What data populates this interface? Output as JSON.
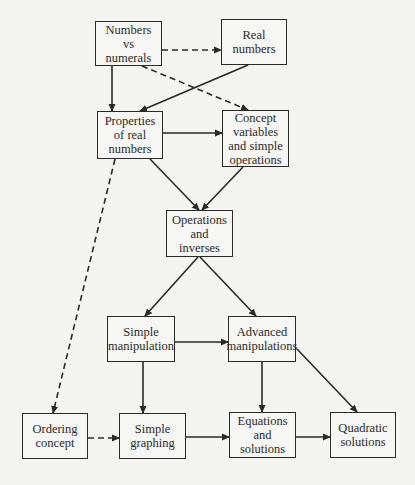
{
  "diagram": {
    "type": "flowchart",
    "nodes": [
      {
        "id": "numbers_vs_numerals",
        "label": "Numbers\nvs\nnumerals",
        "x": 95,
        "y": 21,
        "w": 67,
        "h": 45
      },
      {
        "id": "real_numbers",
        "label": "Real\nnumbers",
        "x": 221,
        "y": 19,
        "w": 66,
        "h": 46
      },
      {
        "id": "properties_of_real_numbers",
        "label": "Properties\nof real\nnumbers",
        "x": 97,
        "y": 111,
        "w": 66,
        "h": 48
      },
      {
        "id": "concept_variables",
        "label": "Concept\nvariables\nand simple\noperations",
        "x": 222,
        "y": 110,
        "w": 67,
        "h": 57
      },
      {
        "id": "operations_and_inverses",
        "label": "Operations\nand\ninverses",
        "x": 166,
        "y": 210,
        "w": 67,
        "h": 47
      },
      {
        "id": "simple_manipulation",
        "label": "Simple\nmanipulation",
        "x": 107,
        "y": 316,
        "w": 68,
        "h": 46
      },
      {
        "id": "advanced_manipulations",
        "label": "Advanced\nmanipulations",
        "x": 228,
        "y": 316,
        "w": 68,
        "h": 46
      },
      {
        "id": "ordering_concept",
        "label": "Ordering\nconcept",
        "x": 22,
        "y": 413,
        "w": 66,
        "h": 46
      },
      {
        "id": "simple_graphing",
        "label": "Simple\ngraphing",
        "x": 119,
        "y": 413,
        "w": 67,
        "h": 46
      },
      {
        "id": "equations_and_solutions",
        "label": "Equations\nand\nsolutions",
        "x": 229,
        "y": 412,
        "w": 67,
        "h": 46
      },
      {
        "id": "quadratic_solutions",
        "label": "Quadratic\nsolutions",
        "x": 330,
        "y": 412,
        "w": 66,
        "h": 46
      }
    ],
    "edges": [
      {
        "from": "numbers_vs_numerals",
        "to": "real_numbers",
        "style": "dashed",
        "x1": 162,
        "y1": 50,
        "x2": 221,
        "y2": 50
      },
      {
        "from": "numbers_vs_numerals",
        "to": "properties_of_real_numbers",
        "style": "solid",
        "x1": 112,
        "y1": 66,
        "x2": 112,
        "y2": 111
      },
      {
        "from": "real_numbers",
        "to": "properties_of_real_numbers",
        "style": "solid",
        "x1": 248,
        "y1": 65,
        "x2": 140,
        "y2": 111
      },
      {
        "from": "numbers_vs_numerals",
        "to": "concept_variables",
        "style": "dashed",
        "x1": 142,
        "y1": 66,
        "x2": 248,
        "y2": 110
      },
      {
        "from": "properties_of_real_numbers",
        "to": "concept_variables",
        "style": "solid",
        "x1": 163,
        "y1": 133,
        "x2": 222,
        "y2": 133
      },
      {
        "from": "properties_of_real_numbers",
        "to": "operations_and_inverses",
        "style": "solid",
        "x1": 150,
        "y1": 159,
        "x2": 199,
        "y2": 210
      },
      {
        "from": "concept_variables",
        "to": "operations_and_inverses",
        "style": "solid",
        "x1": 243,
        "y1": 167,
        "x2": 202,
        "y2": 210
      },
      {
        "from": "properties_of_real_numbers",
        "to": "ordering_concept",
        "style": "dashed",
        "x1": 115,
        "y1": 159,
        "x2": 53,
        "y2": 413
      },
      {
        "from": "operations_and_inverses",
        "to": "simple_manipulation",
        "style": "solid",
        "x1": 198,
        "y1": 257,
        "x2": 145,
        "y2": 316
      },
      {
        "from": "operations_and_inverses",
        "to": "advanced_manipulations",
        "style": "solid",
        "x1": 200,
        "y1": 257,
        "x2": 256,
        "y2": 316
      },
      {
        "from": "simple_manipulation",
        "to": "advanced_manipulations",
        "style": "solid",
        "x1": 175,
        "y1": 342,
        "x2": 228,
        "y2": 342
      },
      {
        "from": "simple_manipulation",
        "to": "simple_graphing",
        "style": "solid",
        "x1": 143,
        "y1": 362,
        "x2": 143,
        "y2": 413
      },
      {
        "from": "advanced_manipulations",
        "to": "equations_and_solutions",
        "style": "solid",
        "x1": 262,
        "y1": 362,
        "x2": 262,
        "y2": 412
      },
      {
        "from": "advanced_manipulations",
        "to": "quadratic_solutions",
        "style": "solid",
        "x1": 297,
        "y1": 349,
        "x2": 357,
        "y2": 412
      },
      {
        "from": "ordering_concept",
        "to": "simple_graphing",
        "style": "dashed",
        "x1": 88,
        "y1": 438,
        "x2": 119,
        "y2": 438
      },
      {
        "from": "simple_graphing",
        "to": "equations_and_solutions",
        "style": "solid",
        "x1": 186,
        "y1": 437,
        "x2": 229,
        "y2": 437
      },
      {
        "from": "equations_and_solutions",
        "to": "quadratic_solutions",
        "style": "solid",
        "x1": 296,
        "y1": 437,
        "x2": 330,
        "y2": 437
      }
    ],
    "colors": {
      "line": "#2a2a2a",
      "background": "#f4f4f2",
      "box_fill": "#f6f6f4"
    }
  }
}
